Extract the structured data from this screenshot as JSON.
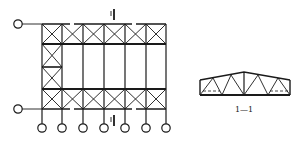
{
  "diagram": {
    "type": "structural-plan-and-section",
    "plan": {
      "description": "Roof plan with bracing grid",
      "columns": 7,
      "section_mark_top": "1",
      "section_mark_bottom": "1",
      "column_supports": 7,
      "side_supports": 2
    },
    "section": {
      "label": "1—1",
      "description": "Trapezoidal roof truss cross-section"
    },
    "colors": {
      "line": "#1a1a1a",
      "background": "#ffffff"
    }
  }
}
